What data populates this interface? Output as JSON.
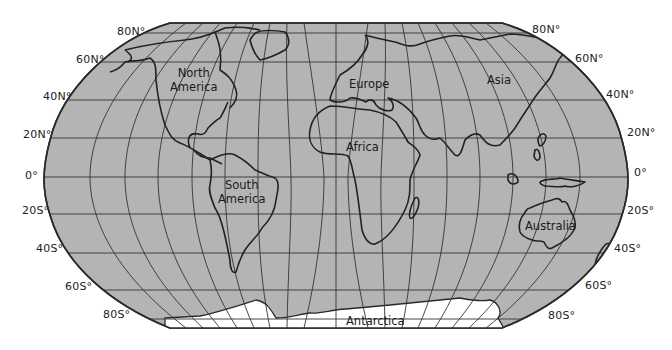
{
  "map": {
    "projection": "Robinson",
    "fill_color": "#b4b4b4",
    "ice_color": "#ffffff",
    "line_color": "#2a2a2a",
    "latitude_labels_left": [
      "80N°",
      "60N°",
      "40N°",
      "20N°",
      "0°",
      "20S°",
      "40S°",
      "60S°",
      "80S°"
    ],
    "latitude_labels_right": [
      "80N°",
      "60N°",
      "40N°",
      "20N°",
      "0°",
      "20S°",
      "40S°",
      "60S°",
      "80S°"
    ],
    "regions": {
      "north_america": [
        "North",
        "America"
      ],
      "south_america": [
        "South",
        "America"
      ],
      "europe": "Europe",
      "africa": "Africa",
      "asia": "Asia",
      "australia": "Australia",
      "antarctica": "Antarctica"
    }
  }
}
